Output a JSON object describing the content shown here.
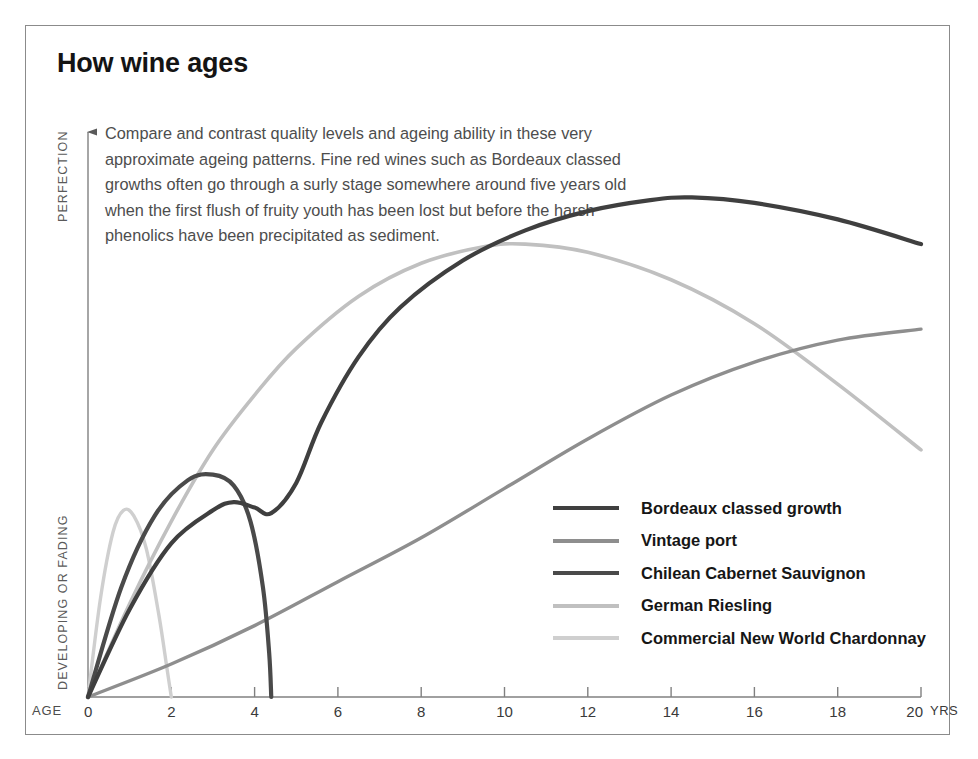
{
  "title": "How wine ages",
  "intro": "Compare and contrast quality levels and ageing ability in these very approximate ageing patterns. Fine red wines such as Bordeaux classed growths often go through a surly stage somewhere around five years old when the first flush of fruity youth has been lost but before the harsh phenolics have been precipitated as sediment.",
  "axes": {
    "y_top_label": "PERFECTION",
    "y_bottom_label": "DEVELOPING OR FADING",
    "x_prefix_label": "AGE",
    "x_suffix_label": "YRS",
    "x_ticks": [
      0,
      2,
      4,
      6,
      8,
      10,
      12,
      14,
      16,
      18,
      20
    ]
  },
  "legend": [
    {
      "label": "Bordeaux classed growth",
      "color": "#3f3f3f"
    },
    {
      "label": "Vintage port",
      "color": "#8e8e8e"
    },
    {
      "label": "Chilean Cabernet Sauvignon",
      "color": "#4a4a4a"
    },
    {
      "label": "German Riesling",
      "color": "#c0c0c0"
    },
    {
      "label": "Commercial New World Chardonnay",
      "color": "#cfcfcf"
    }
  ],
  "chart_data": {
    "type": "line",
    "title": "How wine ages",
    "xlabel": "AGE (YRS)",
    "ylabel": "Quality: DEVELOPING OR FADING to PERFECTION",
    "xlim": [
      0,
      20
    ],
    "ylim": [
      0,
      100
    ],
    "grid": false,
    "legend_position": "inside-right",
    "x_ticks": [
      0,
      2,
      4,
      6,
      8,
      10,
      12,
      14,
      16,
      18,
      20
    ],
    "series": [
      {
        "name": "Bordeaux classed growth",
        "color": "#3f3f3f",
        "width": 4.2,
        "points": [
          [
            0,
            0
          ],
          [
            1,
            16
          ],
          [
            2,
            28
          ],
          [
            3,
            34
          ],
          [
            3.5,
            35.5
          ],
          [
            4,
            34.5
          ],
          [
            4.4,
            33.5
          ],
          [
            5,
            39
          ],
          [
            5.6,
            50
          ],
          [
            6.5,
            62
          ],
          [
            7.5,
            71
          ],
          [
            9,
            79.5
          ],
          [
            10.5,
            85
          ],
          [
            12,
            88.5
          ],
          [
            13.5,
            90.5
          ],
          [
            14.5,
            91
          ],
          [
            16,
            90
          ],
          [
            18,
            87
          ],
          [
            20,
            82.5
          ]
        ]
      },
      {
        "name": "Vintage port",
        "color": "#8e8e8e",
        "width": 3.4,
        "points": [
          [
            0,
            0
          ],
          [
            2,
            6
          ],
          [
            4,
            13
          ],
          [
            6,
            21
          ],
          [
            8,
            29
          ],
          [
            10,
            38
          ],
          [
            12,
            47
          ],
          [
            14,
            55
          ],
          [
            16,
            61
          ],
          [
            18,
            65
          ],
          [
            20,
            67
          ]
        ]
      },
      {
        "name": "Chilean Cabernet Sauvignon",
        "color": "#4a4a4a",
        "width": 4.2,
        "points": [
          [
            0,
            0
          ],
          [
            0.8,
            20
          ],
          [
            1.6,
            33
          ],
          [
            2.4,
            39.5
          ],
          [
            3,
            40.5
          ],
          [
            3.5,
            38.5
          ],
          [
            3.9,
            32
          ],
          [
            4.2,
            20
          ],
          [
            4.35,
            8
          ],
          [
            4.4,
            0
          ]
        ]
      },
      {
        "name": "German Riesling",
        "color": "#c0c0c0",
        "width": 3.6,
        "points": [
          [
            0,
            0
          ],
          [
            1,
            17
          ],
          [
            2,
            32
          ],
          [
            3,
            45
          ],
          [
            4,
            55
          ],
          [
            5,
            63.5
          ],
          [
            6.5,
            73
          ],
          [
            8,
            79
          ],
          [
            9.5,
            82
          ],
          [
            10.5,
            82.5
          ],
          [
            12,
            81
          ],
          [
            14,
            76
          ],
          [
            16,
            68
          ],
          [
            18,
            57
          ],
          [
            20,
            45
          ]
        ]
      },
      {
        "name": "Commercial New World Chardonnay",
        "color": "#cfcfcf",
        "width": 3.4,
        "points": [
          [
            0,
            0
          ],
          [
            0.3,
            18
          ],
          [
            0.6,
            30
          ],
          [
            0.85,
            34
          ],
          [
            1.1,
            33
          ],
          [
            1.4,
            27
          ],
          [
            1.7,
            15
          ],
          [
            1.9,
            5
          ],
          [
            2,
            0
          ]
        ]
      }
    ]
  }
}
